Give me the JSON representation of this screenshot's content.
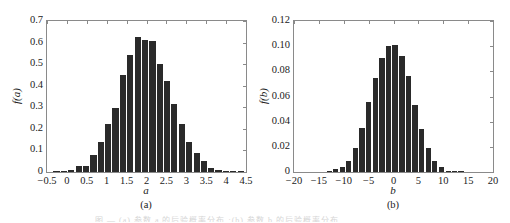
{
  "chart_data": [
    {
      "type": "bar",
      "panel_label": "(a)",
      "title": "",
      "xlabel": "a",
      "ylabel": "f(a)",
      "xlim": [
        -0.5,
        4.5
      ],
      "ylim": [
        0,
        0.7
      ],
      "xticks": [
        "-0.5",
        "0",
        "0.5",
        "1",
        "1.5",
        "2",
        "2.5",
        "3",
        "3.5",
        "4",
        "4.5"
      ],
      "yticks": [
        "0",
        "0.1",
        "0.2",
        "0.3",
        "0.4",
        "0.5",
        "0.6",
        "0.7"
      ],
      "grid": false,
      "bin_start": -0.35,
      "bin_width": 0.185,
      "x": [
        -0.26,
        -0.07,
        0.11,
        0.3,
        0.48,
        0.67,
        0.85,
        1.04,
        1.22,
        1.41,
        1.59,
        1.78,
        1.96,
        2.15,
        2.33,
        2.52,
        2.7,
        2.89,
        3.07,
        3.26,
        3.44,
        3.63,
        3.81,
        4.0,
        4.18,
        4.37
      ],
      "values": [
        0.002,
        0.005,
        0.01,
        0.026,
        0.03,
        0.08,
        0.137,
        0.222,
        0.295,
        0.452,
        0.543,
        0.627,
        0.613,
        0.606,
        0.5,
        0.422,
        0.316,
        0.222,
        0.137,
        0.09,
        0.05,
        0.018,
        0.009,
        0.003,
        0.001,
        0.0005
      ]
    },
    {
      "type": "bar",
      "panel_label": "(b)",
      "title": "",
      "xlabel": "b",
      "ylabel": "f(b)",
      "xlim": [
        -20,
        20
      ],
      "ylim": [
        0,
        0.12
      ],
      "xticks": [
        "-20",
        "-15",
        "-10",
        "-5",
        "0",
        "5",
        "10",
        "15",
        "20"
      ],
      "yticks": [
        "0",
        "0.02",
        "0.04",
        "0.06",
        "0.08",
        "0.10",
        "0.12"
      ],
      "grid": false,
      "bin_start": -13.6,
      "bin_width": 1.33,
      "x": [
        -12.9,
        -11.6,
        -10.3,
        -9.0,
        -7.6,
        -6.3,
        -5.0,
        -3.6,
        -2.3,
        -1.0,
        0.3,
        1.7,
        3.0,
        4.3,
        5.6,
        7.0,
        8.3,
        9.6,
        11.0,
        12.3,
        13.6
      ],
      "values": [
        0.0005,
        0.002,
        0.004,
        0.009,
        0.019,
        0.035,
        0.056,
        0.075,
        0.091,
        0.1,
        0.101,
        0.092,
        0.076,
        0.053,
        0.034,
        0.019,
        0.009,
        0.004,
        0.0012,
        0.0008,
        0.0004
      ]
    }
  ],
  "caption": {
    "text": "图 — (a) 参数 a 的后验概率分布 ;(b) 参数 b 的后验概率分布"
  },
  "colors": {
    "bar": "#2a2a2a",
    "frame": "#8a8a8a",
    "background": "#ffffff"
  }
}
